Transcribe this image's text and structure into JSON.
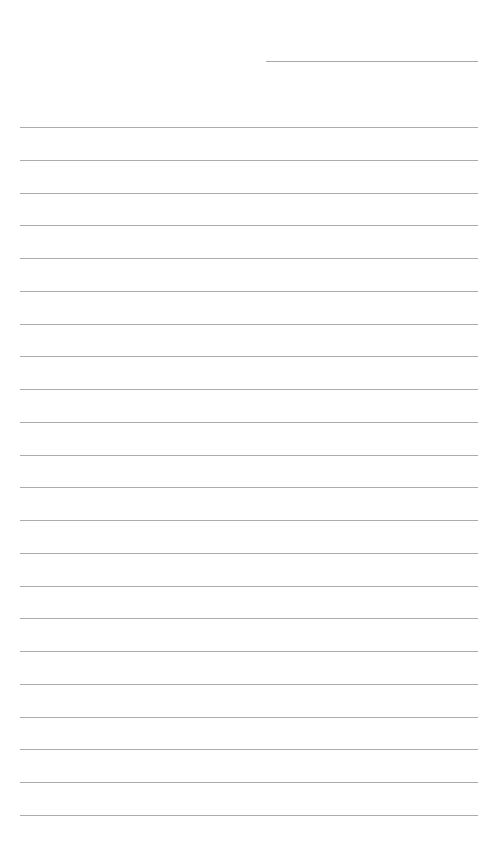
{
  "document": {
    "type": "lined-paper",
    "background_color": "#ffffff",
    "line_color": "#acacac",
    "header_line": {
      "label": "",
      "value": ""
    },
    "ruled_lines": [
      {
        "text": ""
      },
      {
        "text": ""
      },
      {
        "text": ""
      },
      {
        "text": ""
      },
      {
        "text": ""
      },
      {
        "text": ""
      },
      {
        "text": ""
      },
      {
        "text": ""
      },
      {
        "text": ""
      },
      {
        "text": ""
      },
      {
        "text": ""
      },
      {
        "text": ""
      },
      {
        "text": ""
      },
      {
        "text": ""
      },
      {
        "text": ""
      },
      {
        "text": ""
      },
      {
        "text": ""
      },
      {
        "text": ""
      },
      {
        "text": ""
      },
      {
        "text": ""
      },
      {
        "text": ""
      },
      {
        "text": ""
      }
    ]
  }
}
